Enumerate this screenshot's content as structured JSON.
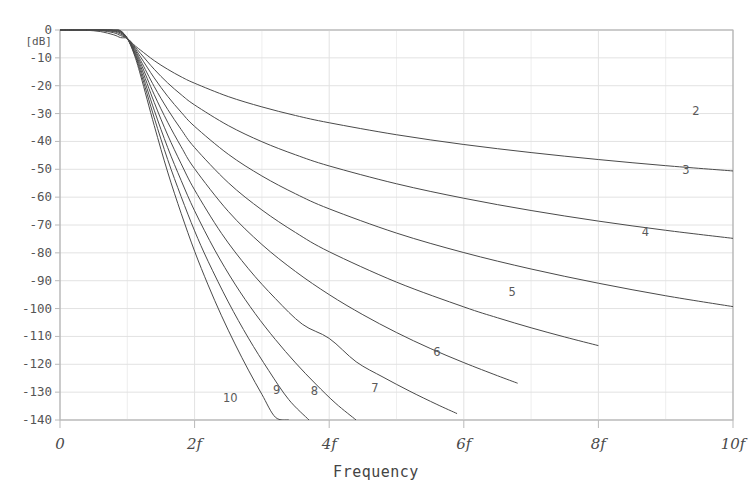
{
  "title": "",
  "chart_data": {
    "type": "line",
    "title": "",
    "subtitle": "",
    "xlabel": "Frequency",
    "ylabel": "[dB]",
    "yunit": "[dB]",
    "xlim": [
      0,
      10
    ],
    "ylim": [
      -140,
      0
    ],
    "grid": true,
    "legend_position": "inline-curve-labels",
    "x_tick_labels": [
      "0",
      "2f",
      "4f",
      "6f",
      "8f",
      "10f"
    ],
    "x_tick_values": [
      0,
      2,
      4,
      6,
      8,
      10
    ],
    "y_tick_labels": [
      "0",
      "-10",
      "-20",
      "-30",
      "-40",
      "-50",
      "-60",
      "-70",
      "-80",
      "-90",
      "-100",
      "-110",
      "-120",
      "-130",
      "-140"
    ],
    "y_tick_values": [
      0,
      -10,
      -20,
      -30,
      -40,
      -50,
      -60,
      -70,
      -80,
      -90,
      -100,
      -110,
      -120,
      -130,
      -140
    ],
    "cutoff_x": 1,
    "curve_color": "#4a4a4a",
    "grid_color": "#e2e2e2",
    "axis_color": "#b9b9b9",
    "series": [
      {
        "name": "2",
        "order": 2,
        "label": "2",
        "label_x": 9.45,
        "label_y": -29.5,
        "points_x": [
          0,
          0.2,
          0.4,
          0.6,
          0.8,
          0.9,
          1.0,
          1.1,
          1.2,
          1.4,
          1.6,
          1.8,
          2.0,
          2.5,
          3.0,
          3.5,
          4.0,
          5.0,
          6.0,
          7.0,
          8.0,
          9.0,
          10.0
        ],
        "points_y": [
          0.0,
          -0.01,
          -0.11,
          -0.56,
          -1.74,
          -2.73,
          -3.01,
          -5.35,
          -7.29,
          -11.0,
          -14.1,
          -16.8,
          -19.1,
          -23.9,
          -27.6,
          -30.7,
          -33.3,
          -37.6,
          -41.1,
          -44.0,
          -46.5,
          -48.7,
          -50.6
        ]
      },
      {
        "name": "3",
        "order": 3,
        "label": "3",
        "label_x": 9.3,
        "label_y": -50.5,
        "points_x": [
          0,
          0.2,
          0.4,
          0.6,
          0.8,
          0.9,
          1.0,
          1.1,
          1.2,
          1.4,
          1.6,
          1.8,
          2.0,
          2.5,
          3.0,
          3.5,
          4.0,
          5.0,
          6.0,
          7.0,
          8.0,
          9.0,
          10.0
        ],
        "points_y": [
          0.0,
          -0.0,
          -0.01,
          -0.2,
          -1.0,
          -2.0,
          -3.01,
          -5.7,
          -8.5,
          -14.1,
          -19.0,
          -23.2,
          -26.9,
          -34.3,
          -40.1,
          -44.8,
          -48.8,
          -55.2,
          -60.4,
          -64.8,
          -68.6,
          -71.9,
          -74.8
        ]
      },
      {
        "name": "4",
        "order": 4,
        "label": "4",
        "label_x": 8.7,
        "label_y": -73.0,
        "points_x": [
          0,
          0.2,
          0.4,
          0.6,
          0.8,
          0.9,
          1.0,
          1.1,
          1.2,
          1.4,
          1.6,
          1.8,
          2.0,
          2.5,
          3.0,
          3.5,
          4.0,
          5.0,
          6.0,
          7.0,
          8.0,
          9.0,
          10.0
        ],
        "points_y": [
          0.0,
          0.0,
          0.0,
          -0.06,
          -0.58,
          -1.5,
          -3.01,
          -6.1,
          -9.8,
          -17.2,
          -23.8,
          -29.5,
          -34.6,
          -44.6,
          -52.4,
          -58.8,
          -64.2,
          -72.9,
          -79.9,
          -85.8,
          -90.9,
          -95.4,
          -99.3
        ]
      },
      {
        "name": "5",
        "order": 5,
        "label": "5",
        "label_x": 6.72,
        "label_y": -94.5,
        "points_x": [
          0,
          0.2,
          0.4,
          0.6,
          0.8,
          0.9,
          1.0,
          1.1,
          1.2,
          1.4,
          1.6,
          1.8,
          2.0,
          2.5,
          3.0,
          3.5,
          4.0,
          5.0,
          6.0,
          6.5,
          7.0,
          7.5,
          8.0
        ],
        "points_y": [
          0.0,
          0.0,
          0.0,
          -0.02,
          -0.34,
          -1.1,
          -3.01,
          -6.5,
          -11.0,
          -20.3,
          -28.5,
          -35.7,
          -42.2,
          -54.8,
          -64.6,
          -72.7,
          -79.6,
          -90.5,
          -99.4,
          -103.3,
          -106.9,
          -110.2,
          -113.3
        ]
      },
      {
        "name": "6",
        "order": 6,
        "label": "6",
        "label_x": 5.6,
        "label_y": -116.0,
        "points_x": [
          0,
          0.2,
          0.4,
          0.6,
          0.8,
          0.9,
          1.0,
          1.1,
          1.2,
          1.4,
          1.6,
          1.8,
          2.0,
          2.5,
          3.0,
          3.5,
          4.0,
          4.5,
          5.0,
          5.5,
          6.0,
          6.5,
          6.8
        ],
        "points_y": [
          0.0,
          0.0,
          0.0,
          -0.01,
          -0.2,
          -0.83,
          -3.01,
          -6.9,
          -12.0,
          -23.2,
          -33.1,
          -41.9,
          -49.8,
          -65.1,
          -77.0,
          -86.7,
          -95.0,
          -102.2,
          -108.6,
          -114.3,
          -119.4,
          -124.1,
          -126.8
        ]
      },
      {
        "name": "7",
        "order": 7,
        "label": "7",
        "label_x": 4.68,
        "label_y": -129.0,
        "points_x": [
          0,
          0.2,
          0.4,
          0.6,
          0.8,
          0.9,
          1.0,
          1.1,
          1.2,
          1.4,
          1.6,
          1.8,
          2.0,
          2.4,
          2.8,
          3.2,
          3.6,
          4.0,
          4.4,
          4.8,
          5.2,
          5.6,
          5.9
        ],
        "points_y": [
          0.0,
          0.0,
          0.0,
          0.0,
          -0.12,
          -0.62,
          -3.01,
          -7.4,
          -13.1,
          -26.0,
          -37.7,
          -48.0,
          -57.4,
          -73.0,
          -85.7,
          -96.4,
          -105.6,
          -110.7,
          -119.1,
          -124.6,
          -129.7,
          -134.4,
          -137.7
        ]
      },
      {
        "name": "8",
        "order": 8,
        "label": "8",
        "label_x": 3.78,
        "label_y": -130.0,
        "points_x": [
          0,
          0.2,
          0.4,
          0.6,
          0.8,
          0.9,
          1.0,
          1.1,
          1.2,
          1.4,
          1.6,
          1.8,
          2.0,
          2.3,
          2.6,
          2.9,
          3.2,
          3.5,
          3.8,
          4.1,
          4.4,
          4.7,
          5.0
        ],
        "points_y": [
          0.0,
          0.0,
          0.0,
          0.0,
          -0.07,
          -0.47,
          -3.01,
          -7.8,
          -14.2,
          -28.8,
          -42.2,
          -54.0,
          -64.9,
          -79.0,
          -91.2,
          -101.8,
          -111.1,
          -119.5,
          -127.1,
          -134.1,
          -140.0,
          -140.0,
          -140.0
        ]
      },
      {
        "name": "9",
        "order": 9,
        "label": "9",
        "label_x": 3.22,
        "label_y": -129.5,
        "points_x": [
          0,
          0.2,
          0.4,
          0.6,
          0.8,
          0.9,
          1.0,
          1.1,
          1.2,
          1.4,
          1.6,
          1.8,
          2.0,
          2.2,
          2.5,
          2.8,
          3.1,
          3.4,
          3.7,
          4.0,
          4.3
        ],
        "points_y": [
          0.0,
          0.0,
          0.0,
          0.0,
          -0.04,
          -0.35,
          -3.01,
          -8.2,
          -15.3,
          -31.5,
          -46.5,
          -59.8,
          -72.1,
          -83.0,
          -97.6,
          -110.6,
          -122.2,
          -132.7,
          -140.0,
          -140.0,
          -140.0
        ]
      },
      {
        "name": "10",
        "order": 10,
        "label": "10",
        "label_x": 2.53,
        "label_y": -132.5,
        "points_x": [
          0,
          0.2,
          0.4,
          0.6,
          0.8,
          0.9,
          1.0,
          1.1,
          1.2,
          1.4,
          1.6,
          1.8,
          2.0,
          2.2,
          2.4,
          2.6,
          2.8,
          3.0,
          3.2,
          3.4,
          3.6
        ],
        "points_y": [
          0.0,
          0.0,
          0.0,
          0.0,
          -0.02,
          -0.26,
          -3.01,
          -8.6,
          -16.5,
          -34.3,
          -51.0,
          -65.8,
          -79.4,
          -91.5,
          -102.6,
          -112.7,
          -122.1,
          -130.8,
          -139.0,
          -140.0,
          -140.0
        ]
      }
    ]
  }
}
